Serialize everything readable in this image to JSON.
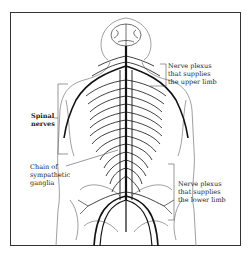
{
  "diagram": {
    "labels": {
      "spinal_nerves": "Spinal\nnerves",
      "chain_of_sympathetic_ganglia": "Chain of\nsympathetic\nganglia",
      "upper_limb_plexus": "Nerve plexus\nthat supplies\nthe upper limb",
      "lower_limb_plexus": "Nerve plexus\nthat supplies\nthe lower limb"
    },
    "colors": {
      "border": "#333333",
      "nerve": "#111111",
      "outline": "#666666",
      "text": "#222222"
    }
  }
}
